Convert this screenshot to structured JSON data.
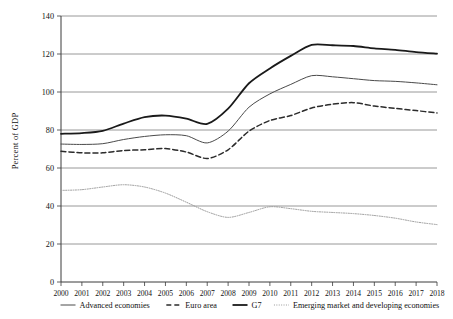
{
  "chart_data": {
    "type": "line",
    "title": "",
    "xlabel": "",
    "ylabel": "Percent of GDP",
    "ylim": [
      0,
      140
    ],
    "ytick_labels": [
      "0",
      "20",
      "40",
      "60",
      "80",
      "100",
      "120",
      "140"
    ],
    "ytick_values": [
      0,
      20,
      40,
      60,
      80,
      100,
      120,
      140
    ],
    "grid": true,
    "legend_position": "bottom",
    "x": [
      2000,
      2001,
      2002,
      2003,
      2004,
      2005,
      2006,
      2007,
      2008,
      2009,
      2010,
      2011,
      2012,
      2013,
      2014,
      2015,
      2016,
      2017,
      2018
    ],
    "xtick_labels": [
      "2000",
      "2001",
      "2002",
      "2003",
      "2004",
      "2005",
      "2006",
      "2007",
      "2008",
      "2009",
      "2010",
      "2011",
      "2012",
      "2013",
      "2014",
      "2015",
      "2016",
      "2017",
      "2018"
    ],
    "series": [
      {
        "name": "Advanced economies",
        "style": "solid-thin",
        "color": "#4a4a4a",
        "values": [
          72.6,
          72.4,
          72.8,
          75.0,
          76.6,
          77.5,
          77.0,
          73.2,
          79.4,
          92.0,
          99.0,
          104.0,
          108.6,
          108.0,
          107.0,
          106.0,
          105.6,
          104.8,
          103.8
        ]
      },
      {
        "name": "Euro area",
        "style": "dashed",
        "color": "#2b2b2b",
        "values": [
          68.8,
          68.0,
          68.0,
          69.2,
          69.6,
          70.2,
          68.4,
          65.0,
          69.6,
          79.4,
          85.0,
          87.6,
          91.6,
          93.6,
          94.4,
          92.6,
          91.4,
          90.2,
          89.0
        ]
      },
      {
        "name": "G7",
        "style": "solid-thick",
        "color": "#1a1a1a",
        "values": [
          78.0,
          78.4,
          79.6,
          83.4,
          86.8,
          87.6,
          86.0,
          83.2,
          91.2,
          104.6,
          112.4,
          119.0,
          124.8,
          124.6,
          124.2,
          123.0,
          122.2,
          121.0,
          120.2
        ]
      },
      {
        "name": "Emerging market and developing economies",
        "style": "dotted",
        "color": "#9a9a9a",
        "values": [
          48.2,
          48.6,
          50.0,
          51.2,
          50.0,
          46.8,
          42.0,
          37.0,
          34.0,
          36.6,
          39.6,
          38.6,
          37.2,
          36.6,
          36.0,
          35.0,
          33.6,
          31.6,
          30.2
        ]
      }
    ]
  },
  "legend": {
    "items": [
      {
        "label": "Advanced economies",
        "marker": "solid-thin-line-icon"
      },
      {
        "label": "Euro area",
        "marker": "dashed-line-icon"
      },
      {
        "label": "G7",
        "marker": "solid-thick-line-icon"
      },
      {
        "label": "Emerging market and developing economies",
        "marker": "dotted-line-icon"
      }
    ]
  }
}
